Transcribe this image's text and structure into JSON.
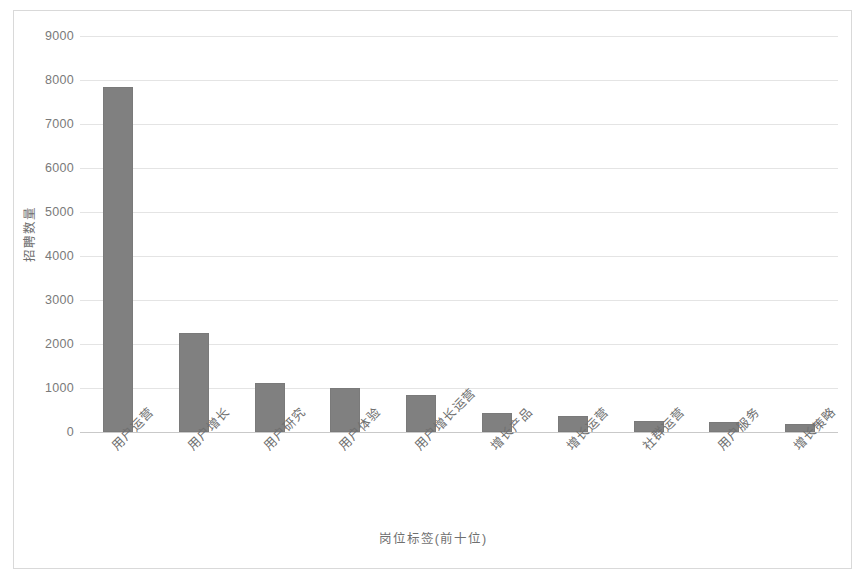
{
  "chart_data": {
    "type": "bar",
    "title": "",
    "xlabel": "岗位标签(前十位)",
    "ylabel": "招聘数量",
    "categories": [
      "用户运营",
      "用户增长",
      "用户研究",
      "用户体验",
      "用户增长运营",
      "增长产品",
      "增长运营",
      "社群运营",
      "用户服务",
      "增长策略"
    ],
    "values": [
      7830,
      2250,
      1110,
      1010,
      840,
      430,
      370,
      260,
      230,
      190
    ],
    "ylim": [
      0,
      9000
    ],
    "yticks": [
      0,
      1000,
      2000,
      3000,
      4000,
      5000,
      6000,
      7000,
      8000,
      9000
    ],
    "ytick_labels": [
      "0",
      "1000",
      "2000",
      "3000",
      "4000",
      "5000",
      "6000",
      "7000",
      "8000",
      "9000"
    ],
    "grid": true,
    "legend": null,
    "bar_color": "#808080",
    "gridline_color": "#e4e4e4",
    "axis_color": "#c9c9c9",
    "text_color": "#6f6f6f",
    "background_color": "#ffffff",
    "frame_color": "#d9d9d9",
    "xtick_rotation": -45
  }
}
